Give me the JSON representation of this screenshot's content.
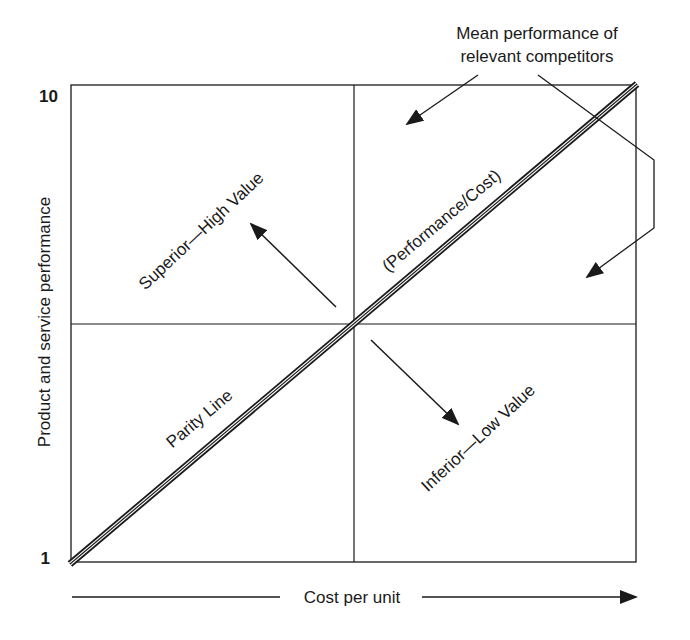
{
  "axes": {
    "y_label": "Product and service performance",
    "y_max_label": "10",
    "y_min_label": "1",
    "x_label": "Cost per unit"
  },
  "annotations": {
    "competitors_line1": "Mean performance of",
    "competitors_line2": "relevant competitors",
    "superior": "Superior—High Value",
    "inferior": "Inferior—Low Value",
    "parity": "Parity Line",
    "ratio": "(Performance/Cost)"
  },
  "colors": {
    "ink": "#1a1a1a",
    "background": "#ffffff"
  }
}
